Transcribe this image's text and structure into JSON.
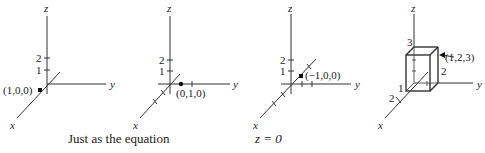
{
  "figures": [
    {
      "id": "fig-a",
      "axes": {
        "x": "x",
        "y": "y",
        "z": "z"
      },
      "z_ticks": [
        "1",
        "2"
      ],
      "point_label": "(1,0,0)"
    },
    {
      "id": "fig-b",
      "axes": {
        "x": "x",
        "y": "y",
        "z": "z"
      },
      "z_ticks": [
        "1",
        "2"
      ],
      "point_label": "(0,1,0)"
    },
    {
      "id": "fig-c",
      "axes": {
        "x": "x",
        "y": "y",
        "z": "z"
      },
      "z_ticks": [
        "1",
        "2"
      ],
      "point_label": "(−1,0,0)"
    },
    {
      "id": "fig-d",
      "axes": {
        "x": "x",
        "y": "y",
        "z": "z"
      },
      "box_labels": {
        "z": "3",
        "x_front": "1",
        "x_back": "2",
        "y": "2"
      },
      "point_label": "(1,2,3)"
    }
  ],
  "caption": {
    "left": "Just as the equation",
    "right": "z = 0"
  }
}
